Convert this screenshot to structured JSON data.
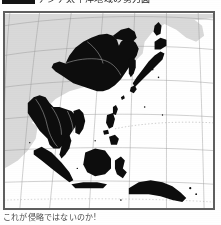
{
  "page": {
    "background_color": "#ffffff",
    "width": 221,
    "height": 225
  },
  "header": {
    "label_block": "",
    "title": "アジア太平洋地域の勢力図",
    "title_color": "#2a2a2a",
    "clipped": true
  },
  "map": {
    "title": "",
    "frame_color": "#5f5f5f",
    "ocean_color": "#ffffff",
    "land_color": "#d9d9d9",
    "highlight_color": "#0d0d0d",
    "border_line_color": "#b9b9b9",
    "graticule_color": "#9a9a9a",
    "projection": "curved-graticule",
    "regions_highlighted": [
      "China",
      "Mongolia",
      "North Korea",
      "South Korea",
      "Japan",
      "Taiwan",
      "Myanmar",
      "Thailand",
      "Laos",
      "Cambodia",
      "Vietnam",
      "Malaysia",
      "Sumatra",
      "Java",
      "Borneo",
      "Sulawesi",
      "Philippines",
      "New Guinea"
    ],
    "regions_land": [
      "Siberia",
      "Central Asia",
      "India"
    ]
  },
  "caption": {
    "text": "これが侵略ではないのか!",
    "color": "#3b3b3b"
  }
}
